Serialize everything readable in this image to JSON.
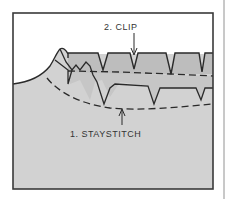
{
  "diagram": {
    "labels": {
      "clip": "2. CLIP",
      "staystitch": "1. STAYSTITCH"
    },
    "colors": {
      "background": "#ffffff",
      "fabric": "#cfcfcf",
      "fabric_light": "#d6d6d6",
      "seam_allowance": "#bdbdbd",
      "line": "#2a2a2a",
      "border": "#3a3a3a"
    }
  }
}
